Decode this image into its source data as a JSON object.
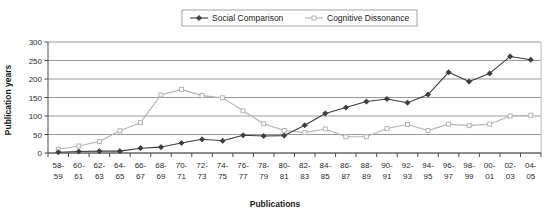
{
  "chart_data": {
    "type": "line",
    "title": "",
    "xlabel": "Publications",
    "ylabel": "Publication years",
    "ylim": [
      0,
      300
    ],
    "yticks": [
      0,
      50,
      100,
      150,
      200,
      250,
      300
    ],
    "grid": true,
    "legend_position": "top-center",
    "categories": [
      "58-59",
      "60-61",
      "62-63",
      "64-65",
      "66-67",
      "68-69",
      "70-71",
      "72-73",
      "74-75",
      "76-77",
      "78-79",
      "80-81",
      "82-83",
      "84-85",
      "86-87",
      "88-89",
      "90-91",
      "92-93",
      "94-95",
      "96-97",
      "98-99",
      "00-01",
      "02-03",
      "04-05"
    ],
    "series": [
      {
        "name": "Social Comparison",
        "color": "#3d3d3d",
        "marker": "diamond",
        "values": [
          2,
          4,
          5,
          5,
          13,
          16,
          27,
          37,
          33,
          48,
          46,
          47,
          75,
          107,
          123,
          139,
          146,
          136,
          158,
          218,
          193,
          215,
          261,
          252
        ]
      },
      {
        "name": "Cognitive Dissonance",
        "color": "#b4b4b4",
        "marker": "square",
        "values": [
          10,
          19,
          31,
          60,
          82,
          157,
          172,
          155,
          149,
          114,
          79,
          61,
          55,
          65,
          44,
          44,
          66,
          77,
          61,
          78,
          74,
          78,
          100,
          102
        ]
      }
    ]
  },
  "legend": {
    "items": [
      {
        "label": "Social Comparison"
      },
      {
        "label": "Cognitive Dissonance"
      }
    ]
  },
  "axes": {
    "y_title": "Publication years",
    "x_title": "Publications"
  }
}
